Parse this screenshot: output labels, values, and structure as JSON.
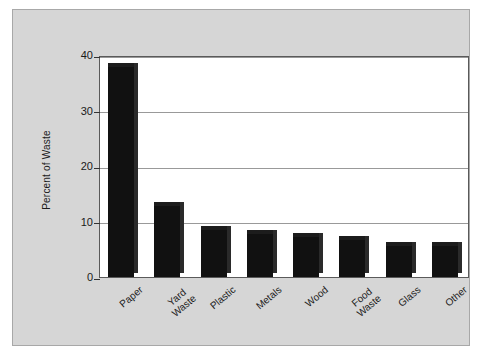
{
  "chart_data": {
    "type": "bar",
    "title": "",
    "xlabel": "",
    "ylabel": "Percent of Waste",
    "categories": [
      "Paper",
      "Yard\nWaste",
      "Plastic",
      "Metals",
      "Wood",
      "Food\nWaste",
      "Glass",
      "Other"
    ],
    "values": [
      37.8,
      12.8,
      8.5,
      7.8,
      7.2,
      6.6,
      5.6,
      5.6
    ],
    "ylim": [
      0,
      40
    ],
    "yticks": [
      0,
      10,
      20,
      30,
      40
    ],
    "ytick_labels": [
      "0",
      "10",
      "20",
      "30",
      "40"
    ],
    "grid": true,
    "grid_axis": "y",
    "legend": "none",
    "bar_color": "#111111",
    "plot_background": "#ffffff",
    "figure_background": "#d6d6d6",
    "axis_color": "#5a5a5a",
    "gridline_color": "#999999"
  },
  "figure": {
    "panel_background": "#d6d6d6",
    "panel_border": "#a8a8a8"
  }
}
